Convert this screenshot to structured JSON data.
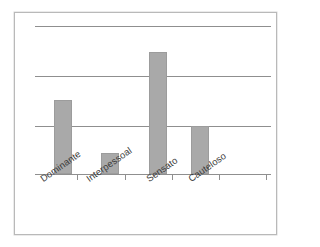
{
  "chart_data": {
    "type": "bar",
    "title": "",
    "subtitle": "",
    "xlabel": "",
    "ylabel": "",
    "categories": [
      "Dominante",
      "Interpessoal",
      "Sensato",
      "Cauteloso"
    ],
    "values": [
      1.48,
      0.42,
      2.44,
      0.96
    ],
    "ylim": [
      0,
      2.96
    ],
    "yticks": [
      1,
      2,
      3
    ],
    "ytick_labels": [
      "",
      "",
      ""
    ],
    "gridlines": {
      "horizontal": true,
      "vertical": false,
      "count": 3,
      "color": "#8f8f8f"
    },
    "legend": {
      "visible": false,
      "position": "none",
      "entries": []
    },
    "annotations": [],
    "bar_color": "#a9a9a9",
    "bar_border_color": "#9c9c9c",
    "axis_color": "#8f8f8f",
    "background_color": "#ffffff",
    "frame_color": "#b9b9b9",
    "label_rotation_deg": -35
  },
  "figure": {
    "frame_label": "figure-border",
    "axis": {
      "baseline_label": "category-axis",
      "tick_count": 5
    }
  }
}
